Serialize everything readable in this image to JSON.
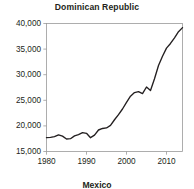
{
  "chart_data": {
    "type": "line",
    "title": "Dominican Republic",
    "xlabel": "",
    "ylabel": "",
    "xlim": [
      1980,
      2014
    ],
    "ylim": [
      15000,
      40000
    ],
    "grid": false,
    "legend": null,
    "x_ticks": [
      "1980",
      "1990",
      "2000",
      "2010"
    ],
    "x_tick_values": [
      1980,
      1990,
      2000,
      2010
    ],
    "y_ticks": [
      "15,000",
      "20,000",
      "25,000",
      "30,000",
      "35,000",
      "40,000"
    ],
    "y_tick_values": [
      15000,
      20000,
      25000,
      30000,
      35000,
      40000
    ],
    "line_color": "#231f20",
    "x": [
      1980,
      1981,
      1982,
      1983,
      1984,
      1985,
      1986,
      1987,
      1988,
      1989,
      1990,
      1991,
      1992,
      1993,
      1994,
      1995,
      1996,
      1997,
      1998,
      1999,
      2000,
      2001,
      2002,
      2003,
      2004,
      2005,
      2006,
      2007,
      2008,
      2009,
      2010,
      2011,
      2012,
      2013,
      2014
    ],
    "values": [
      17700,
      17750,
      17900,
      18250,
      18000,
      17450,
      17500,
      18050,
      18300,
      18700,
      18550,
      17700,
      18200,
      19200,
      19500,
      19600,
      20100,
      21200,
      22200,
      23300,
      24600,
      25800,
      26500,
      26700,
      26300,
      27600,
      26900,
      29200,
      31800,
      33600,
      35200,
      36100,
      37200,
      38400,
      39200
    ],
    "series": [
      {
        "name": "Dominican Republic",
        "values": [
          17700,
          17750,
          17900,
          18250,
          18000,
          17450,
          17500,
          18050,
          18300,
          18700,
          18550,
          17700,
          18200,
          19200,
          19500,
          19600,
          20100,
          21200,
          22200,
          23300,
          24600,
          25800,
          26500,
          26700,
          26300,
          27600,
          26900,
          29200,
          31800,
          33600,
          35200,
          36100,
          37200,
          38400,
          39200
        ]
      }
    ]
  },
  "next_panel": {
    "title": "Mexico"
  }
}
